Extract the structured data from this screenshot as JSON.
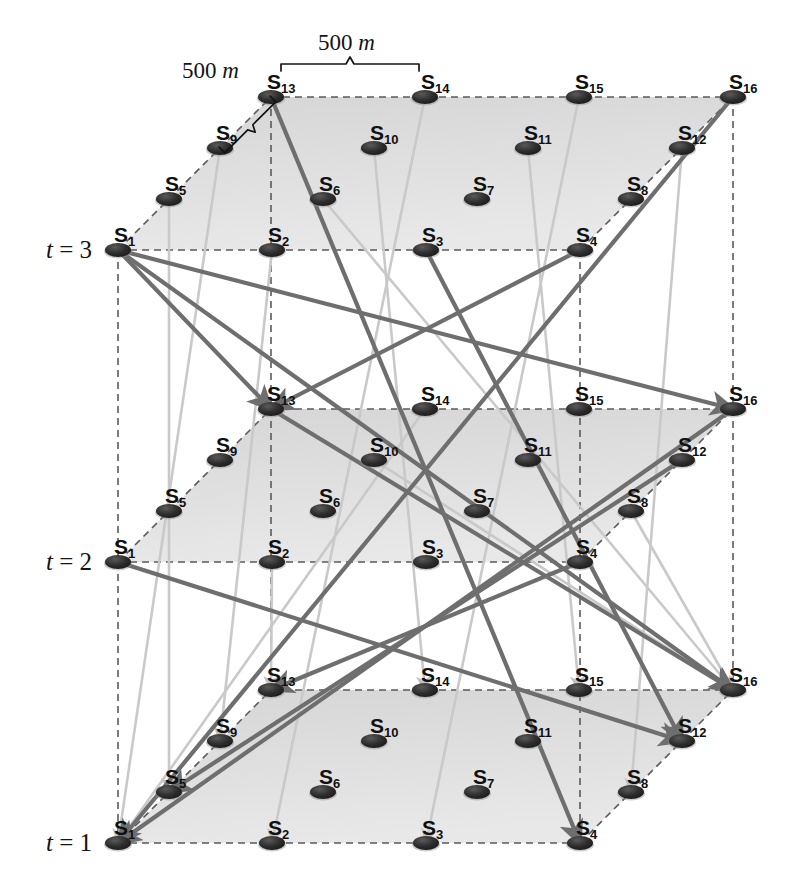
{
  "figure": {
    "node_prefix": "S",
    "node_count_per_plane": 16,
    "grid_rows": 4,
    "grid_cols": 4
  },
  "time_labels": [
    {
      "name": "t-label-3",
      "text": "t = 3",
      "var": "t",
      "value": "3",
      "x": 46,
      "y": 236
    },
    {
      "name": "t-label-2",
      "text": "t = 2",
      "var": "t",
      "value": "2",
      "x": 46,
      "y": 548
    },
    {
      "name": "t-label-1",
      "text": "t = 1",
      "var": "t",
      "value": "1",
      "x": 46,
      "y": 829
    }
  ],
  "dimensions": [
    {
      "name": "dimension-horizontal",
      "text": "500 m",
      "value": "500",
      "unit": "m",
      "x": 318,
      "y": 30,
      "between": [
        "S13",
        "S14"
      ]
    },
    {
      "name": "dimension-diagonal",
      "text": "500 m",
      "value": "500",
      "unit": "m",
      "x": 182,
      "y": 58,
      "between": [
        "S9",
        "S13"
      ]
    }
  ],
  "planes": [
    {
      "name": "plane-t3",
      "time": "3",
      "origin_x": 118,
      "origin_y": 250
    },
    {
      "name": "plane-t2",
      "time": "2",
      "origin_x": 118,
      "origin_y": 562
    },
    {
      "name": "plane-t1",
      "time": "1",
      "origin_x": 118,
      "origin_y": 843
    }
  ],
  "geometry": {
    "col_step_x": 154,
    "col_step_y": 0,
    "row_step_x": 51,
    "row_step_y": -51,
    "node_rx": 13,
    "node_ry": 7
  },
  "node_labels": [
    "S1",
    "S2",
    "S3",
    "S4",
    "S5",
    "S6",
    "S7",
    "S8",
    "S9",
    "S10",
    "S11",
    "S12",
    "S13",
    "S14",
    "S15",
    "S16"
  ],
  "node_subscripts": [
    "1",
    "2",
    "3",
    "4",
    "5",
    "6",
    "7",
    "8",
    "9",
    "10",
    "11",
    "12",
    "13",
    "14",
    "15",
    "16"
  ],
  "colors": {
    "node_fill": "#2b2b2b",
    "plane_fill": "#dcdcdc",
    "wireframe": "#5a5a5a",
    "arrow_dark": "#6e6e6e",
    "arrow_light": "#c9c9c9",
    "text": "#141414",
    "background": "#ffffff"
  },
  "trajectories": [
    {
      "name": "traj-1",
      "from": {
        "plane": 1,
        "node": 1
      },
      "to": {
        "plane": 2,
        "node": 13
      },
      "style": "dark"
    },
    {
      "name": "traj-2",
      "from": {
        "plane": 1,
        "node": 1
      },
      "to": {
        "plane": 2,
        "node": 16
      },
      "style": "dark"
    },
    {
      "name": "traj-3",
      "from": {
        "plane": 2,
        "node": 13
      },
      "to": {
        "plane": 3,
        "node": 16
      },
      "style": "dark"
    },
    {
      "name": "traj-4",
      "from": {
        "plane": 1,
        "node": 1
      },
      "to": {
        "plane": 3,
        "node": 16
      },
      "style": "dark"
    },
    {
      "name": "traj-5",
      "from": {
        "plane": 1,
        "node": 4
      },
      "to": {
        "plane": 2,
        "node": 13
      },
      "style": "dark"
    },
    {
      "name": "traj-6",
      "from": {
        "plane": 2,
        "node": 16
      },
      "to": {
        "plane": 3,
        "node": 1
      },
      "style": "dark"
    },
    {
      "name": "traj-7",
      "from": {
        "plane": 1,
        "node": 16
      },
      "to": {
        "plane": 3,
        "node": 1
      },
      "style": "dark"
    },
    {
      "name": "traj-8",
      "from": {
        "plane": 2,
        "node": 4
      },
      "to": {
        "plane": 3,
        "node": 13
      },
      "style": "dark"
    },
    {
      "name": "traj-9",
      "from": {
        "plane": 1,
        "node": 13
      },
      "to": {
        "plane": 3,
        "node": 4
      },
      "style": "dark"
    },
    {
      "name": "traj-10",
      "from": {
        "plane": 2,
        "node": 1
      },
      "to": {
        "plane": 3,
        "node": 12
      },
      "style": "dark"
    },
    {
      "name": "traj-11",
      "from": {
        "plane": 1,
        "node": 3
      },
      "to": {
        "plane": 3,
        "node": 12
      },
      "style": "dark"
    },
    {
      "name": "traj-12",
      "from": {
        "plane": 2,
        "node": 12
      },
      "to": {
        "plane": 3,
        "node": 5
      },
      "style": "dark"
    },
    {
      "name": "traj-13",
      "from": {
        "plane": 1,
        "node": 2
      },
      "to": {
        "plane": 3,
        "node": 9
      },
      "style": "light"
    },
    {
      "name": "traj-14",
      "from": {
        "plane": 1,
        "node": 14
      },
      "to": {
        "plane": 3,
        "node": 2
      },
      "style": "light"
    },
    {
      "name": "traj-15",
      "from": {
        "plane": 1,
        "node": 15
      },
      "to": {
        "plane": 3,
        "node": 3
      },
      "style": "light"
    },
    {
      "name": "traj-16",
      "from": {
        "plane": 1,
        "node": 10
      },
      "to": {
        "plane": 3,
        "node": 14
      },
      "style": "light"
    },
    {
      "name": "traj-17",
      "from": {
        "plane": 1,
        "node": 11
      },
      "to": {
        "plane": 3,
        "node": 15
      },
      "style": "light"
    },
    {
      "name": "traj-18",
      "from": {
        "plane": 2,
        "node": 2
      },
      "to": {
        "plane": 3,
        "node": 13
      },
      "style": "light"
    },
    {
      "name": "traj-19",
      "from": {
        "plane": 1,
        "node": 12
      },
      "to": {
        "plane": 3,
        "node": 8
      },
      "style": "light"
    },
    {
      "name": "traj-20",
      "from": {
        "plane": 1,
        "node": 9
      },
      "to": {
        "plane": 3,
        "node": 1
      },
      "style": "light"
    },
    {
      "name": "traj-21",
      "from": {
        "plane": 2,
        "node": 14
      },
      "to": {
        "plane": 3,
        "node": 1
      },
      "style": "light"
    },
    {
      "name": "traj-22",
      "from": {
        "plane": 2,
        "node": 10
      },
      "to": {
        "plane": 3,
        "node": 16
      },
      "style": "light"
    },
    {
      "name": "traj-23",
      "from": {
        "plane": 1,
        "node": 6
      },
      "to": {
        "plane": 3,
        "node": 16
      },
      "style": "light"
    },
    {
      "name": "traj-24",
      "from": {
        "plane": 2,
        "node": 8
      },
      "to": {
        "plane": 3,
        "node": 16
      },
      "style": "light"
    },
    {
      "name": "traj-25",
      "from": {
        "plane": 1,
        "node": 5
      },
      "to": {
        "plane": 3,
        "node": 5
      },
      "style": "light"
    }
  ]
}
